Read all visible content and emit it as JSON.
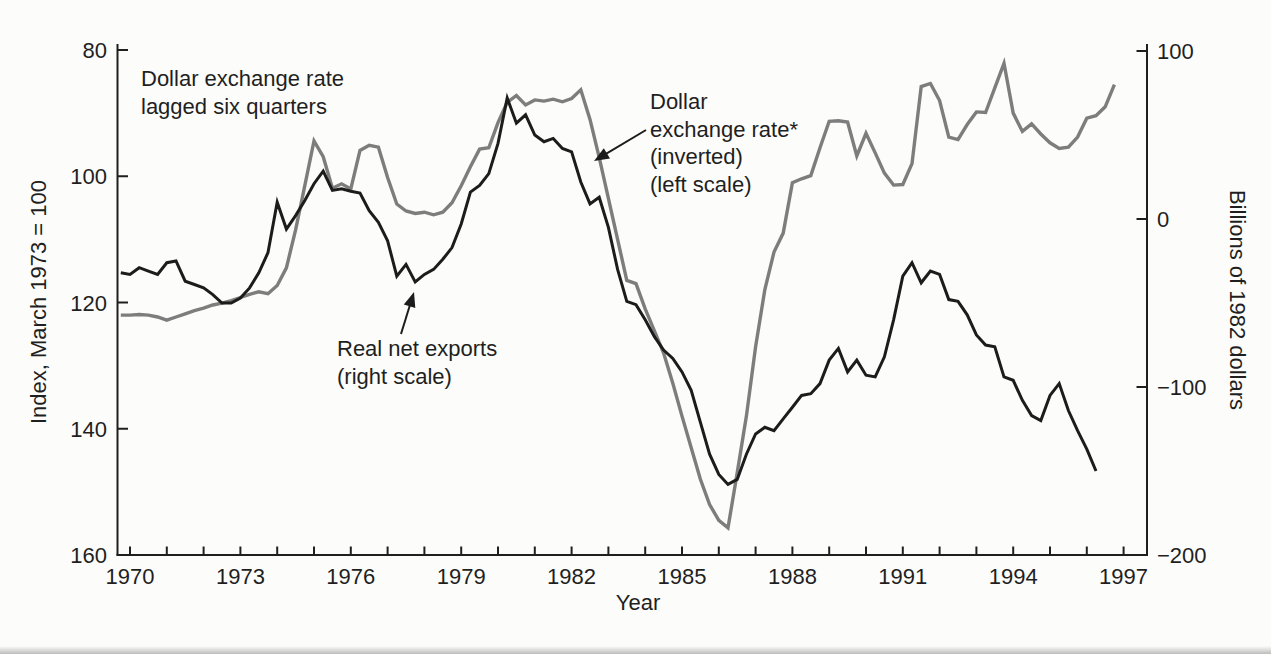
{
  "figure": {
    "background": "#fcfcfa",
    "accent_colors": {
      "exchange_rate_line": "#7d7d7d",
      "net_exports_line": "#1c1c1c"
    }
  },
  "chart_data": {
    "type": "line",
    "title": "",
    "x_axis": {
      "label": "Year",
      "range": [
        1969.6,
        1997.7
      ],
      "major_tick_labels": [
        "1970",
        "1973",
        "1976",
        "1979",
        "1982",
        "1985",
        "1988",
        "1991",
        "1994",
        "1997"
      ],
      "major_tick_years": [
        1970,
        1973,
        1976,
        1979,
        1982,
        1985,
        1988,
        1991,
        1994,
        1997
      ],
      "minor_tick_years": [
        1970,
        1971,
        1972,
        1973,
        1974,
        1975,
        1976,
        1977,
        1978,
        1979,
        1980,
        1981,
        1982,
        1983,
        1984,
        1985,
        1986,
        1987,
        1988,
        1989,
        1990,
        1991,
        1992,
        1993,
        1994,
        1995,
        1996,
        1997
      ]
    },
    "left_axis": {
      "label": "Index, March 1973 = 100",
      "ticks": [
        80,
        100,
        120,
        140,
        160
      ],
      "tick_labels": [
        "80",
        "100",
        "120",
        "140",
        "160"
      ],
      "range": [
        80,
        160
      ],
      "inverted": true
    },
    "right_axis": {
      "label": "Billions of 1982 dollars",
      "ticks": [
        100,
        0,
        -100,
        -200
      ],
      "tick_labels": [
        "100",
        "0",
        "−100",
        "−200"
      ],
      "range": [
        -200,
        100
      ]
    },
    "grid": false,
    "legend": "annotations-with-arrows",
    "series": [
      {
        "id": "exchange_rate",
        "name": "Dollar exchange rate* (inverted) (left scale)",
        "axis": "left",
        "color": "#7d7d7d",
        "stroke_width": 3.4,
        "x_start": 1969.75,
        "x_step": 0.25,
        "values": [
          122.0,
          122.0,
          121.9,
          122.0,
          122.3,
          122.8,
          122.3,
          121.8,
          121.3,
          120.9,
          120.4,
          120.1,
          119.7,
          119.2,
          118.7,
          118.3,
          118.6,
          117.3,
          114.5,
          108.5,
          101.5,
          94.4,
          96.9,
          101.9,
          101.2,
          102.0,
          95.9,
          95.1,
          95.4,
          100.2,
          104.4,
          105.5,
          105.9,
          105.7,
          106.1,
          105.7,
          104.2,
          101.5,
          98.5,
          95.7,
          95.5,
          91.5,
          88.3,
          87.2,
          88.7,
          87.9,
          88.1,
          87.8,
          88.2,
          87.7,
          86.3,
          91.0,
          97.0,
          103.5,
          110.0,
          116.5,
          117.0,
          121.0,
          124.5,
          128.0,
          132.8,
          138.0,
          143.0,
          148.0,
          152.0,
          154.5,
          155.7,
          147.0,
          138.0,
          127.0,
          118.0,
          112.0,
          109.0,
          101.0,
          100.4,
          99.9,
          95.5,
          91.3,
          91.2,
          91.4,
          96.8,
          93.2,
          96.3,
          99.5,
          101.4,
          101.3,
          98.0,
          85.8,
          85.3,
          88.0,
          93.8,
          94.2,
          91.8,
          89.8,
          89.9,
          86.0,
          82.1,
          90.0,
          92.9,
          91.7,
          93.3,
          94.7,
          95.6,
          95.4,
          93.8,
          90.8,
          90.4,
          89.0,
          85.5
        ]
      },
      {
        "id": "net_exports",
        "name": "Real net exports (right scale)",
        "axis": "right",
        "color": "#1c1c1c",
        "stroke_width": 3.0,
        "x_start": 1969.75,
        "x_step": 0.25,
        "values": [
          -32,
          -33,
          -29,
          -31,
          -33,
          -26,
          -25,
          -37,
          -39,
          -41,
          -45,
          -50,
          -50,
          -47,
          -41,
          -32,
          -20,
          10,
          -6,
          2,
          11,
          21,
          28.5,
          17,
          18,
          16.5,
          15.5,
          5,
          -2,
          -13,
          -34,
          -27,
          -37.5,
          -33,
          -30,
          -24,
          -17,
          -3,
          16,
          20,
          27,
          45,
          72,
          57,
          62,
          50,
          46,
          48,
          42,
          40,
          22,
          9,
          13,
          -5,
          -30,
          -49,
          -51,
          -60,
          -70,
          -78,
          -83,
          -91,
          -102,
          -121,
          -140,
          -152,
          -158,
          -155,
          -140,
          -128,
          -124,
          -126,
          -119,
          -112,
          -105,
          -104,
          -98,
          -84,
          -77,
          -91,
          -84,
          -93,
          -94,
          -82,
          -60,
          -34,
          -26,
          -38,
          -31,
          -33,
          -48,
          -49,
          -57,
          -69,
          -75,
          -76,
          -94,
          -96,
          -108,
          -117,
          -120,
          -105,
          -98,
          -114,
          -126,
          -137,
          -150
        ]
      }
    ],
    "annotations": [
      {
        "id": "lag-note",
        "lines": [
          "Dollar exchange rate",
          "lagged six quarters"
        ],
        "x": 141,
        "y": 86,
        "line_height": 28,
        "align": "start"
      },
      {
        "id": "exchange-rate-label",
        "lines": [
          "Dollar",
          "exchange rate*",
          "(inverted)",
          "(left scale)"
        ],
        "x": 650,
        "y": 109,
        "line_height": 27.5,
        "align": "start",
        "arrow": {
          "x1": 646,
          "y1": 130,
          "x2": 594,
          "y2": 161
        }
      },
      {
        "id": "net-exports-label",
        "lines": [
          "Real net exports",
          "(right scale)"
        ],
        "x": 337,
        "y": 356,
        "line_height": 28,
        "align": "start",
        "arrow": {
          "x1": 401,
          "y1": 334,
          "x2": 414,
          "y2": 292
        }
      }
    ]
  }
}
